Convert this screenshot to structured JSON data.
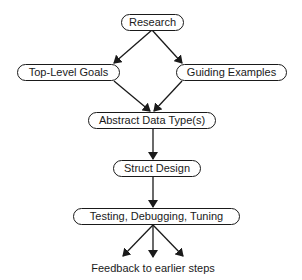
{
  "diagram": {
    "type": "flowchart",
    "nodes": {
      "research": {
        "label": "Research"
      },
      "top_level_goals": {
        "label": "Top-Level Goals"
      },
      "guiding_examples": {
        "label": "Guiding Examples"
      },
      "abstract_data_types": {
        "label": "Abstract Data Type(s)"
      },
      "struct_design": {
        "label": "Struct Design"
      },
      "testing": {
        "label": "Testing, Debugging, Tuning"
      }
    },
    "edges": [
      {
        "from": "Research",
        "to": "Top-Level Goals"
      },
      {
        "from": "Research",
        "to": "Guiding Examples"
      },
      {
        "from": "Top-Level Goals",
        "to": "Abstract Data Type(s)"
      },
      {
        "from": "Guiding Examples",
        "to": "Abstract Data Type(s)"
      },
      {
        "from": "Abstract Data Type(s)",
        "to": "Struct Design"
      },
      {
        "from": "Struct Design",
        "to": "Testing, Debugging, Tuning"
      },
      {
        "from": "Testing, Debugging, Tuning",
        "to": "Feedback to earlier steps",
        "count": 3
      }
    ],
    "feedback_caption": "Feedback to earlier steps",
    "colors": {
      "stroke": "#1a1a1a",
      "background": "#ffffff"
    }
  }
}
